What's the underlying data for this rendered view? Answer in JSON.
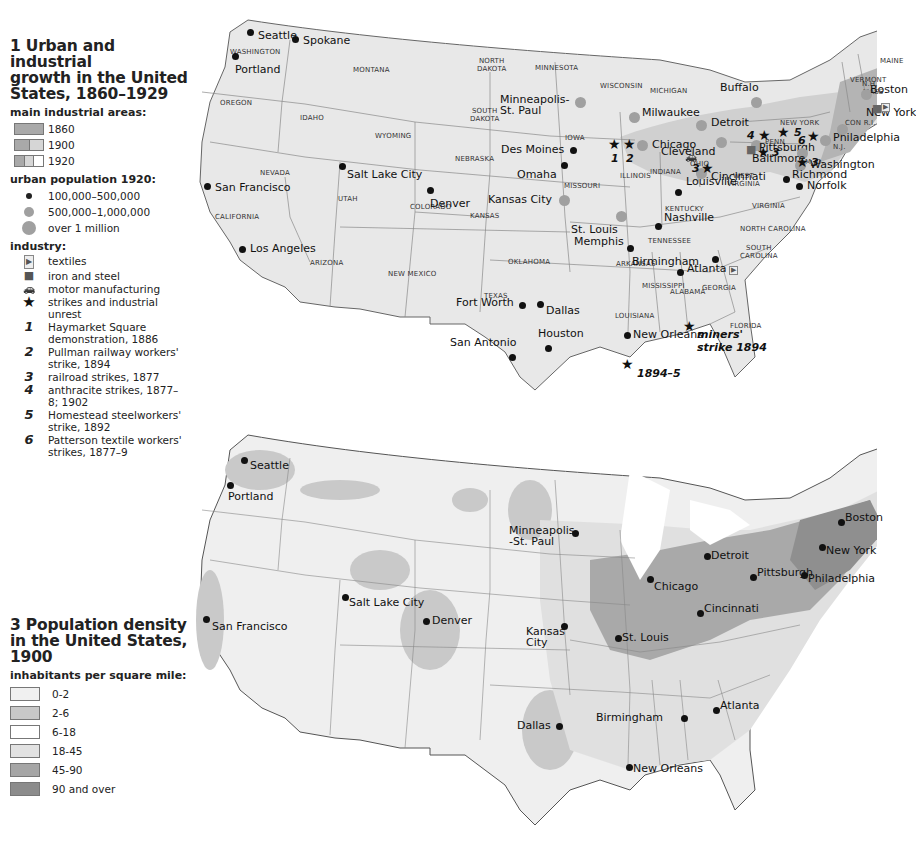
{
  "legend1": {
    "title_line1": "1 Urban and industrial",
    "title_line2": "growth in the United",
    "title_line3": "States, 1860–1929",
    "industrial_heading": "main industrial areas:",
    "industrial_areas": [
      {
        "label": "1860",
        "colors": [
          "#a9a9a9"
        ]
      },
      {
        "label": "1900",
        "colors": [
          "#a9a9a9",
          "#d6d6d6"
        ]
      },
      {
        "label": "1920",
        "colors": [
          "#a9a9a9",
          "#d6d6d6",
          "#ffffff"
        ]
      }
    ],
    "urban_heading": "urban population 1920:",
    "urban_population": [
      {
        "label": "100,000–500,000",
        "size": 6,
        "color": "#222222"
      },
      {
        "label": "500,000–1,000,000",
        "size": 10,
        "color": "#a0a0a0"
      },
      {
        "label": "over 1 million",
        "size": 14,
        "color": "#a0a0a0"
      }
    ],
    "industry_heading": "industry:",
    "industry": [
      {
        "icon": "textiles-icon",
        "glyph": "▶",
        "label": "textiles"
      },
      {
        "icon": "iron-steel-icon",
        "glyph": "■",
        "label": "iron and steel"
      },
      {
        "icon": "car-icon",
        "glyph": "🚗",
        "label": "motor manufacturing"
      },
      {
        "icon": "star-icon",
        "glyph": "★",
        "label": "strikes and industrial unrest"
      }
    ],
    "strikes": [
      {
        "num": "1",
        "label": "Haymarket Square demonstration, 1886"
      },
      {
        "num": "2",
        "label": "Pullman railway workers' strike, 1894"
      },
      {
        "num": "3",
        "label": "railroad strikes, 1877"
      },
      {
        "num": "4",
        "label": "anthracite strikes, 1877–8; 1902"
      },
      {
        "num": "5",
        "label": "Homestead steelworkers' strike, 1892"
      },
      {
        "num": "6",
        "label": "Patterson textile workers' strikes, 1877–9"
      }
    ]
  },
  "legend3": {
    "title_line1": "3 Population density",
    "title_line2": "in the United States,",
    "title_line3": "1900",
    "density_heading": "inhabitants per square mile:",
    "density": [
      {
        "label": "0-2",
        "color": "#f0f0f0"
      },
      {
        "label": "2-6",
        "color": "#c8c8c8"
      },
      {
        "label": "6-18",
        "color": "#ffffff"
      },
      {
        "label": "18-45",
        "color": "#e2e2e2"
      },
      {
        "label": "45-90",
        "color": "#a6a6a6"
      },
      {
        "label": "90 and over",
        "color": "#8c8c8c"
      }
    ]
  },
  "map1": {
    "land_color": "#e6e6e6",
    "border_color": "#888888",
    "cities": [
      {
        "name": "Seattle",
        "x": 60,
        "y": 20,
        "lx": 8,
        "ly": -2
      },
      {
        "name": "Spokane",
        "x": 105,
        "y": 27,
        "lx": 8,
        "ly": -4
      },
      {
        "name": "Portland",
        "x": 45,
        "y": 44,
        "lx": 0,
        "ly": 8
      },
      {
        "name": "San Francisco",
        "x": 17,
        "y": 174,
        "lx": 8,
        "ly": -4
      },
      {
        "name": "Los Angeles",
        "x": 52,
        "y": 237,
        "lx": 8,
        "ly": -6
      },
      {
        "name": "Salt Lake City",
        "x": 152,
        "y": 154,
        "lx": 5,
        "ly": 3
      },
      {
        "name": "Denver",
        "x": 240,
        "y": 178,
        "lx": 0,
        "ly": 8
      },
      {
        "name": "Minneapolis-\nSt. Paul",
        "x": 390,
        "y": 90,
        "lx": -80,
        "ly": -8,
        "big": true
      },
      {
        "name": "Des Moines",
        "x": 383,
        "y": 138,
        "lx": -72,
        "ly": -6
      },
      {
        "name": "Omaha",
        "x": 374,
        "y": 153,
        "lx": -47,
        "ly": 4
      },
      {
        "name": "Kansas City",
        "x": 374,
        "y": 188,
        "lx": -76,
        "ly": -6,
        "big": true
      },
      {
        "name": "St. Louis",
        "x": 431,
        "y": 204,
        "lx": -50,
        "ly": 8,
        "big": true
      },
      {
        "name": "Chicago",
        "x": 452,
        "y": 133,
        "lx": 10,
        "ly": -6,
        "big": true
      },
      {
        "name": "Milwaukee",
        "x": 444,
        "y": 105,
        "lx": 8,
        "ly": -10,
        "big": true
      },
      {
        "name": "Detroit",
        "x": 511,
        "y": 113,
        "lx": 10,
        "ly": -8,
        "big": true
      },
      {
        "name": "Buffalo",
        "x": 566,
        "y": 90,
        "lx": -36,
        "ly": -20,
        "big": true
      },
      {
        "name": "Cleveland",
        "x": 531,
        "y": 130,
        "lx": -60,
        "ly": 4,
        "big": true
      },
      {
        "name": "Cincinnati",
        "x": 511,
        "y": 161,
        "lx": 10,
        "ly": -2,
        "big": true
      },
      {
        "name": "Pittsburgh",
        "x": 566,
        "y": 133,
        "lx": 3,
        "ly": -3,
        "big": true
      },
      {
        "name": "Baltimore",
        "x": 612,
        "y": 141,
        "lx": -50,
        "ly": 0,
        "big": true
      },
      {
        "name": "Washington",
        "x": 610,
        "y": 153,
        "lx": 10,
        "ly": -6,
        "big": true
      },
      {
        "name": "Philadelphia",
        "x": 635,
        "y": 128,
        "lx": 8,
        "ly": -8,
        "big": true
      },
      {
        "name": "New York",
        "x": 652,
        "y": 117,
        "lx": 24,
        "ly": -22,
        "big": true
      },
      {
        "name": "Boston",
        "x": 676,
        "y": 82,
        "lx": 4,
        "ly": -10,
        "big": true
      },
      {
        "name": "Richmond",
        "x": 596,
        "y": 167,
        "lx": 6,
        "ly": -10
      },
      {
        "name": "Norfolk",
        "x": 609,
        "y": 174,
        "lx": 8,
        "ly": -6
      },
      {
        "name": "Louisville",
        "x": 488,
        "y": 180,
        "lx": 8,
        "ly": -16
      },
      {
        "name": "Nashville",
        "x": 468,
        "y": 214,
        "lx": 6,
        "ly": -14
      },
      {
        "name": "Memphis",
        "x": 440,
        "y": 236,
        "lx": -56,
        "ly": -12
      },
      {
        "name": "Birmingham",
        "x": 490,
        "y": 260,
        "lx": -48,
        "ly": -16
      },
      {
        "name": "Atlanta",
        "x": 525,
        "y": 247,
        "lx": -28,
        "ly": 4
      },
      {
        "name": "Fort Worth",
        "x": 332,
        "y": 293,
        "lx": -66,
        "ly": -8
      },
      {
        "name": "Dallas",
        "x": 350,
        "y": 292,
        "lx": 6,
        "ly": 1
      },
      {
        "name": "Houston",
        "x": 358,
        "y": 336,
        "lx": -10,
        "ly": -20
      },
      {
        "name": "San Antonio",
        "x": 322,
        "y": 345,
        "lx": -62,
        "ly": -20
      },
      {
        "name": "New Orleans",
        "x": 437,
        "y": 323,
        "lx": 6,
        "ly": -6
      }
    ],
    "states": [
      {
        "name": "WASHINGTON",
        "x": 40,
        "y": 36
      },
      {
        "name": "OREGON",
        "x": 30,
        "y": 87
      },
      {
        "name": "IDAHO",
        "x": 110,
        "y": 102
      },
      {
        "name": "MONTANA",
        "x": 163,
        "y": 54
      },
      {
        "name": "WYOMING",
        "x": 185,
        "y": 120
      },
      {
        "name": "NEVADA",
        "x": 70,
        "y": 157
      },
      {
        "name": "UTAH",
        "x": 148,
        "y": 183
      },
      {
        "name": "COLORADO",
        "x": 220,
        "y": 191
      },
      {
        "name": "CALIFORNIA",
        "x": 25,
        "y": 201
      },
      {
        "name": "ARIZONA",
        "x": 120,
        "y": 247
      },
      {
        "name": "NEW MEXICO",
        "x": 198,
        "y": 258
      },
      {
        "name": "NORTH\nDAKOTA",
        "x": 287,
        "y": 45
      },
      {
        "name": "SOUTH\nDAKOTA",
        "x": 280,
        "y": 95
      },
      {
        "name": "NEBRASKA",
        "x": 265,
        "y": 143
      },
      {
        "name": "KANSAS",
        "x": 280,
        "y": 200
      },
      {
        "name": "OKLAHOMA",
        "x": 318,
        "y": 246
      },
      {
        "name": "TEXAS",
        "x": 294,
        "y": 280
      },
      {
        "name": "MINNESOTA",
        "x": 345,
        "y": 52
      },
      {
        "name": "IOWA",
        "x": 375,
        "y": 122
      },
      {
        "name": "MISSOURI",
        "x": 374,
        "y": 170
      },
      {
        "name": "ARKANSAS",
        "x": 426,
        "y": 248
      },
      {
        "name": "LOUISIANA",
        "x": 425,
        "y": 300
      },
      {
        "name": "WISCONSIN",
        "x": 410,
        "y": 70
      },
      {
        "name": "MICHIGAN",
        "x": 460,
        "y": 75
      },
      {
        "name": "ILLINOIS",
        "x": 430,
        "y": 160
      },
      {
        "name": "INDIANA",
        "x": 460,
        "y": 156
      },
      {
        "name": "OHIO",
        "x": 500,
        "y": 148
      },
      {
        "name": "KENTUCKY",
        "x": 475,
        "y": 193
      },
      {
        "name": "TENNESSEE",
        "x": 458,
        "y": 225
      },
      {
        "name": "MISSISSIPPI",
        "x": 452,
        "y": 270
      },
      {
        "name": "ALABAMA",
        "x": 480,
        "y": 276
      },
      {
        "name": "GEORGIA",
        "x": 512,
        "y": 272
      },
      {
        "name": "FLORIDA",
        "x": 540,
        "y": 310
      },
      {
        "name": "SOUTH\nCAROLINA",
        "x": 550,
        "y": 232
      },
      {
        "name": "NORTH CAROLINA",
        "x": 550,
        "y": 213
      },
      {
        "name": "VIRGINIA",
        "x": 562,
        "y": 190
      },
      {
        "name": "WEST\nVIRGINIA",
        "x": 537,
        "y": 160
      },
      {
        "name": "PENN",
        "x": 575,
        "y": 126
      },
      {
        "name": "NEW YORK",
        "x": 590,
        "y": 107
      },
      {
        "name": "N.J.",
        "x": 643,
        "y": 131
      },
      {
        "name": "M. D.",
        "x": 615,
        "y": 146
      },
      {
        "name": "CON R.I.",
        "x": 655,
        "y": 107
      },
      {
        "name": "MASS",
        "x": 673,
        "y": 76
      },
      {
        "name": "VERMONT",
        "x": 660,
        "y": 64
      },
      {
        "name": "N.H.",
        "x": 672,
        "y": 68
      },
      {
        "name": "MAINE",
        "x": 690,
        "y": 45
      }
    ],
    "strike_markers": [
      {
        "x": 425,
        "y": 132,
        "num": "1",
        "nx": 0,
        "ny": 14
      },
      {
        "x": 440,
        "y": 132,
        "num": "2",
        "nx": 0,
        "ny": 14
      },
      {
        "x": 518,
        "y": 156,
        "num": "3",
        "nx": -12,
        "ny": 0
      },
      {
        "x": 575,
        "y": 123,
        "num": "4",
        "nx": -14,
        "ny": 0
      },
      {
        "x": 594,
        "y": 120,
        "num": "5",
        "nx": 14,
        "ny": 0
      },
      {
        "x": 574,
        "y": 140,
        "num": "3",
        "nx": 12,
        "ny": 0
      },
      {
        "x": 624,
        "y": 124,
        "num": "6",
        "nx": -12,
        "ny": 4
      },
      {
        "x": 613,
        "y": 150,
        "num": "3",
        "nx": 12,
        "ny": 0
      },
      {
        "x": 500,
        "y": 314,
        "num": "",
        "nx": 0,
        "ny": 0
      },
      {
        "x": 438,
        "y": 352,
        "num": "",
        "nx": 0,
        "ny": 0
      }
    ],
    "annotations": [
      {
        "text": "miners'",
        "x": 507,
        "y": 316
      },
      {
        "text": "strike 1894",
        "x": 507,
        "y": 329
      },
      {
        "text": "1894–5",
        "x": 447,
        "y": 355
      }
    ],
    "steel_icons": [
      {
        "x": 556,
        "y": 132
      },
      {
        "x": 682,
        "y": 91
      }
    ],
    "textile_icons": [
      {
        "x": 691,
        "y": 91
      },
      {
        "x": 539,
        "y": 254
      }
    ],
    "car_icons": [
      {
        "x": 495,
        "y": 140
      }
    ]
  },
  "map3": {
    "cities": [
      {
        "name": "Seattle",
        "x": 54,
        "y": 30,
        "lx": 6,
        "ly": 0
      },
      {
        "name": "Portland",
        "x": 40,
        "y": 55,
        "lx": -2,
        "ly": 6
      },
      {
        "name": "San Francisco",
        "x": 16,
        "y": 189,
        "lx": 6,
        "ly": 2
      },
      {
        "name": "Salt Lake City",
        "x": 155,
        "y": 167,
        "lx": 4,
        "ly": 0
      },
      {
        "name": "Denver",
        "x": 236,
        "y": 191,
        "lx": 6,
        "ly": -6
      },
      {
        "name": "Minneapolis\n-St. Paul",
        "x": 385,
        "y": 103,
        "lx": -66,
        "ly": -8
      },
      {
        "name": "Kansas\nCity",
        "x": 374,
        "y": 196,
        "lx": -38,
        "ly": 0
      },
      {
        "name": "St. Louis",
        "x": 428,
        "y": 208,
        "lx": 4,
        "ly": -6
      },
      {
        "name": "Chicago",
        "x": 460,
        "y": 149,
        "lx": 4,
        "ly": 2
      },
      {
        "name": "Detroit",
        "x": 517,
        "y": 126,
        "lx": 4,
        "ly": -6
      },
      {
        "name": "Cincinnati",
        "x": 510,
        "y": 183,
        "lx": 4,
        "ly": -10
      },
      {
        "name": "Pittsburgh",
        "x": 563,
        "y": 147,
        "lx": 4,
        "ly": -10
      },
      {
        "name": "Philadelphia",
        "x": 614,
        "y": 145,
        "lx": 4,
        "ly": -2
      },
      {
        "name": "New York",
        "x": 632,
        "y": 117,
        "lx": 4,
        "ly": -2
      },
      {
        "name": "Boston",
        "x": 651,
        "y": 92,
        "lx": 4,
        "ly": -10
      },
      {
        "name": "Dallas",
        "x": 369,
        "y": 296,
        "lx": -42,
        "ly": -6
      },
      {
        "name": "Birmingham",
        "x": 494,
        "y": 288,
        "lx": -88,
        "ly": -6
      },
      {
        "name": "Atlanta",
        "x": 526,
        "y": 280,
        "lx": 4,
        "ly": -10
      },
      {
        "name": "New Orleans",
        "x": 439,
        "y": 337,
        "lx": 4,
        "ly": -4
      }
    ]
  }
}
